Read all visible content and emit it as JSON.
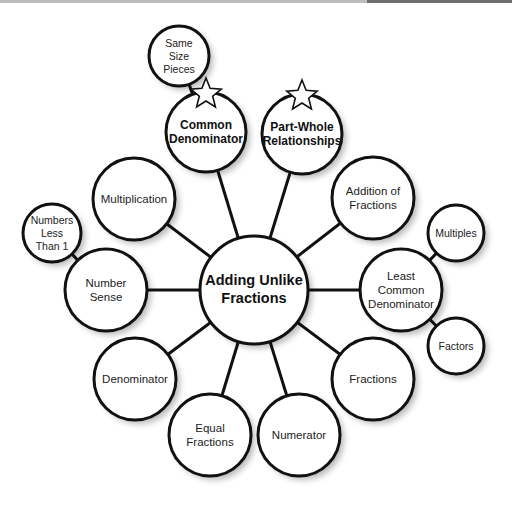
{
  "diagram": {
    "type": "concept-map",
    "center": {
      "id": "center",
      "label_lines": [
        "Adding Unlike",
        "Fractions"
      ],
      "x": 254,
      "y": 290,
      "r": 54,
      "style": "center"
    },
    "nodes": [
      {
        "id": "common-denominator",
        "label_lines": [
          "Common",
          "Denominator"
        ],
        "x": 206,
        "y": 132,
        "r": 40,
        "style": "bold",
        "starred": true
      },
      {
        "id": "part-whole",
        "label_lines": [
          "Part-Whole",
          "Relationships"
        ],
        "x": 302,
        "y": 134,
        "r": 40,
        "style": "bold",
        "starred": true
      },
      {
        "id": "addition-of-fractions",
        "label_lines": [
          "Addition of",
          "Fractions"
        ],
        "x": 373,
        "y": 198,
        "r": 41,
        "style": "normal"
      },
      {
        "id": "least-common-denominator",
        "label_lines": [
          "Least",
          "Common",
          "Denominator"
        ],
        "x": 401,
        "y": 290,
        "r": 41,
        "style": "normal"
      },
      {
        "id": "fractions",
        "label_lines": [
          "Fractions"
        ],
        "x": 373,
        "y": 379,
        "r": 41,
        "style": "normal"
      },
      {
        "id": "numerator",
        "label_lines": [
          "Numerator"
        ],
        "x": 299,
        "y": 435,
        "r": 41,
        "style": "normal"
      },
      {
        "id": "equal-fractions",
        "label_lines": [
          "Equal",
          "Fractions"
        ],
        "x": 210,
        "y": 435,
        "r": 41,
        "style": "normal"
      },
      {
        "id": "denominator",
        "label_lines": [
          "Denominator"
        ],
        "x": 135,
        "y": 379,
        "r": 41,
        "style": "normal"
      },
      {
        "id": "number-sense",
        "label_lines": [
          "Number",
          "Sense"
        ],
        "x": 106,
        "y": 290,
        "r": 41,
        "style": "normal"
      },
      {
        "id": "multiplication",
        "label_lines": [
          "Multiplication"
        ],
        "x": 134,
        "y": 199,
        "r": 41,
        "style": "normal"
      },
      {
        "id": "same-size-pieces",
        "label_lines": [
          "Same",
          "Size",
          "Pieces"
        ],
        "x": 179,
        "y": 56,
        "r": 30,
        "style": "small"
      },
      {
        "id": "numbers-less-than-1",
        "label_lines": [
          "Numbers",
          "Less",
          "Than 1"
        ],
        "x": 52,
        "y": 233,
        "r": 29,
        "style": "small"
      },
      {
        "id": "multiples",
        "label_lines": [
          "Multiples"
        ],
        "x": 456,
        "y": 233,
        "r": 28,
        "style": "small"
      },
      {
        "id": "factors",
        "label_lines": [
          "Factors"
        ],
        "x": 456,
        "y": 346,
        "r": 28,
        "style": "small"
      }
    ],
    "edges": [
      [
        "center",
        "common-denominator"
      ],
      [
        "center",
        "part-whole"
      ],
      [
        "center",
        "addition-of-fractions"
      ],
      [
        "center",
        "least-common-denominator"
      ],
      [
        "center",
        "fractions"
      ],
      [
        "center",
        "numerator"
      ],
      [
        "center",
        "equal-fractions"
      ],
      [
        "center",
        "denominator"
      ],
      [
        "center",
        "number-sense"
      ],
      [
        "center",
        "multiplication"
      ],
      [
        "common-denominator",
        "same-size-pieces"
      ],
      [
        "number-sense",
        "numbers-less-than-1"
      ],
      [
        "least-common-denominator",
        "multiples"
      ],
      [
        "least-common-denominator",
        "factors"
      ]
    ]
  }
}
